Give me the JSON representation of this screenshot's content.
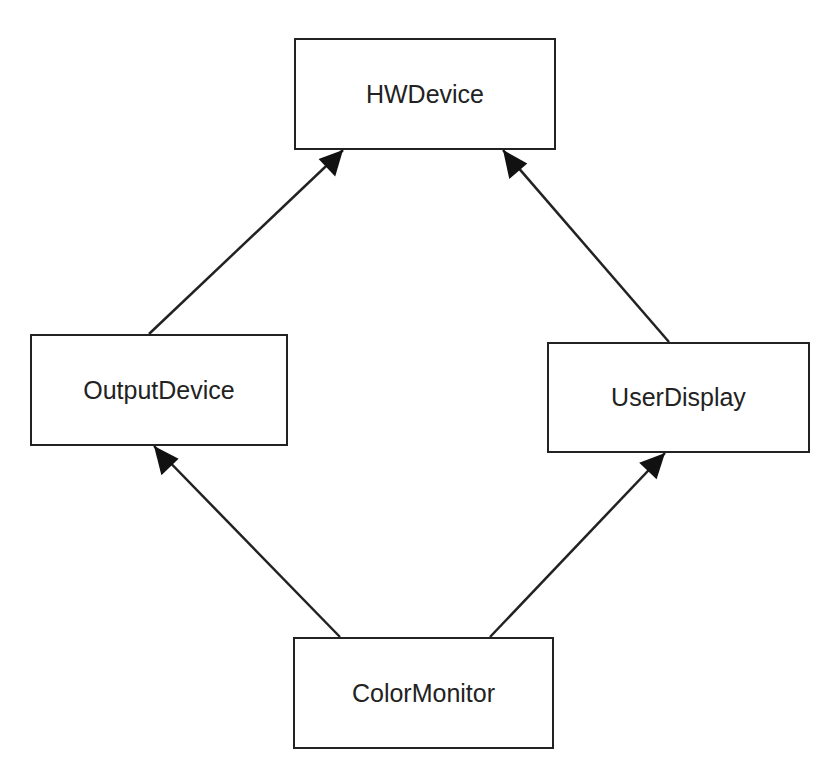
{
  "diagram": {
    "type": "class-inheritance",
    "nodes": [
      {
        "id": "hw",
        "label": "HWDevice"
      },
      {
        "id": "out",
        "label": "OutputDevice"
      },
      {
        "id": "ud",
        "label": "UserDisplay"
      },
      {
        "id": "cm",
        "label": "ColorMonitor"
      }
    ],
    "edges": [
      {
        "from": "OutputDevice",
        "to": "HWDevice",
        "kind": "inherits"
      },
      {
        "from": "UserDisplay",
        "to": "HWDevice",
        "kind": "inherits"
      },
      {
        "from": "ColorMonitor",
        "to": "OutputDevice",
        "kind": "inherits"
      },
      {
        "from": "ColorMonitor",
        "to": "UserDisplay",
        "kind": "inherits"
      }
    ],
    "colors": {
      "stroke": "#222222",
      "background": "#ffffff"
    }
  }
}
